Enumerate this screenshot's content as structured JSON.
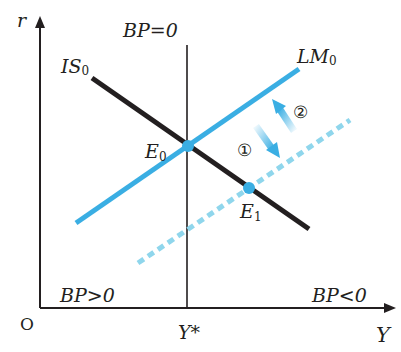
{
  "axes": {
    "y_label": "r",
    "x_label": "Y",
    "origin_label": "O",
    "x_tick_label": "Y*"
  },
  "curves": {
    "is": {
      "label": "IS",
      "sub": "0"
    },
    "lm": {
      "label": "LM",
      "sub": "0"
    },
    "bp": {
      "label": "BP=0"
    }
  },
  "points": {
    "e0": {
      "label": "E",
      "sub": "0"
    },
    "e1": {
      "label": "E",
      "sub": "1"
    }
  },
  "regions": {
    "left": "BP>0",
    "right": "BP<0"
  },
  "arrows": {
    "shift_down": "①",
    "shift_up": "②"
  },
  "colors": {
    "lm": "#3aaee3",
    "lm_shifted": "#8fd6ec",
    "is": "#231f20",
    "axis": "#231f20"
  }
}
